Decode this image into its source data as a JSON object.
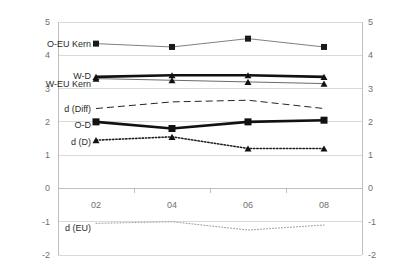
{
  "chart_data": {
    "type": "line",
    "title": "",
    "xlabel": "",
    "ylabel": "",
    "x": [
      "02",
      "04",
      "06",
      "08"
    ],
    "categories": [
      "02",
      "04",
      "06",
      "08"
    ],
    "ylim": [
      -2,
      5
    ],
    "y_ticks": [
      "5",
      "4",
      "3",
      "2",
      "1",
      "0",
      "-1",
      "-2"
    ],
    "y_ticks_right": [
      "5",
      "4",
      "3",
      "2",
      "1",
      "0",
      "-1",
      "-2"
    ],
    "grid": "horizontal",
    "legend_position": "inline-left",
    "dual_axis": true,
    "series": [
      {
        "name": "O-EU Kern",
        "label": "O-EU Kern",
        "values": [
          4.35,
          4.25,
          4.5,
          4.25
        ],
        "marker": "square",
        "line_style": "solid",
        "line_width": "thin",
        "color": "#7f7f7f",
        "marker_color": "#1a1a1a"
      },
      {
        "name": "W-D",
        "label": "W-D",
        "values": [
          3.35,
          3.4,
          3.4,
          3.35
        ],
        "marker": "triangle",
        "line_style": "solid",
        "line_width": "thick",
        "color": "#111111",
        "marker_color": "#111111"
      },
      {
        "name": "W-EU Kern",
        "label": "W-EU Kern",
        "values": [
          3.3,
          3.25,
          3.2,
          3.15
        ],
        "marker": "triangle",
        "line_style": "solid",
        "line_width": "thin",
        "color": "#6b6b6b",
        "marker_color": "#111111"
      },
      {
        "name": "d (Diff)",
        "label": "d (Diff)",
        "values": [
          2.4,
          2.6,
          2.65,
          2.4
        ],
        "marker": "none",
        "line_style": "dashed",
        "line_width": "thin",
        "color": "#262626",
        "marker_color": "#262626"
      },
      {
        "name": "O-D",
        "label": "O-D",
        "values": [
          2.0,
          1.8,
          2.0,
          2.05
        ],
        "marker": "square",
        "line_style": "solid",
        "line_width": "thick",
        "color": "#111111",
        "marker_color": "#111111"
      },
      {
        "name": "d (D)",
        "label": "d (D)",
        "values": [
          1.45,
          1.55,
          1.2,
          1.2
        ],
        "marker": "triangle",
        "line_style": "dotted",
        "line_width": "medium",
        "color": "#1f1f1f",
        "marker_color": "#111111"
      },
      {
        "name": "d (EU)",
        "label": "d (EU)",
        "values": [
          -1.05,
          -1.0,
          -1.25,
          -1.1
        ],
        "marker": "none",
        "line_style": "dotted",
        "line_width": "thin",
        "color": "#9a9a9a",
        "marker_color": "#9a9a9a"
      }
    ],
    "colors": {
      "grid": "#d9d9d9",
      "axis": "#bfbfbf",
      "tick_text": "#6f6f6f",
      "label_text": "#2b2b2b",
      "background": "#ffffff"
    }
  }
}
